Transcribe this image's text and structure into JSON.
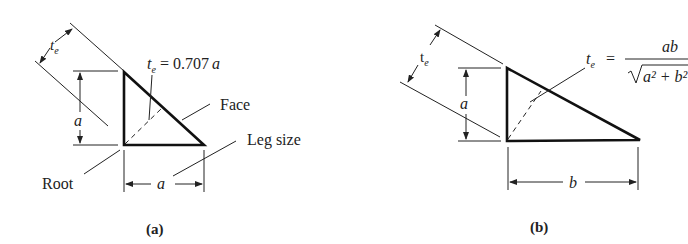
{
  "figure_a": {
    "caption": "(a)",
    "throat_symbol": "t",
    "throat_subscript": "e",
    "throat_formula_rhs": "= 0.707",
    "throat_formula_var": "a",
    "leg_vertical_label": "a",
    "leg_horizontal_label": "a",
    "callouts": {
      "face": "Face",
      "leg_size": "Leg size",
      "root": "Root"
    }
  },
  "figure_b": {
    "caption": "(b)",
    "throat_symbol": "t",
    "throat_subscript": "e",
    "throat_formula_eq": "=",
    "throat_formula_numerator": "ab",
    "throat_formula_denominator": "a² + b²",
    "leg_vertical_label": "a",
    "leg_horizontal_label": "b"
  }
}
